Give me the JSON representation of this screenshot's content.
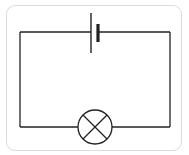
{
  "diagram": {
    "type": "circuit-schematic",
    "components": [
      {
        "id": "cell",
        "kind": "battery-cell",
        "position": "top-center"
      },
      {
        "id": "lamp",
        "kind": "lamp",
        "position": "bottom-center"
      }
    ],
    "connections": [
      {
        "from": "cell",
        "to": "lamp",
        "side": "left"
      },
      {
        "from": "cell",
        "to": "lamp",
        "side": "right"
      }
    ],
    "colors": {
      "wire": "#222222",
      "frame_border": "#dcdcdc",
      "background": "#ffffff"
    }
  }
}
